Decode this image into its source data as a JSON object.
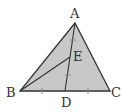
{
  "diagram": {
    "type": "triangle",
    "fill_color": "#c8c8c8",
    "stroke_color": "#333333",
    "points": {
      "A": {
        "label": "A",
        "x": 75,
        "y": 23
      },
      "B": {
        "label": "B",
        "x": 20,
        "y": 91
      },
      "C": {
        "label": "C",
        "x": 110,
        "y": 91
      },
      "D": {
        "label": "D",
        "x": 65,
        "y": 91
      },
      "E": {
        "label": "E",
        "x": 70,
        "y": 57
      }
    },
    "segments": [
      "AB",
      "BC",
      "CA",
      "AD",
      "BE"
    ],
    "equal_marks": [
      "BD = DC",
      "AE = ED"
    ]
  }
}
